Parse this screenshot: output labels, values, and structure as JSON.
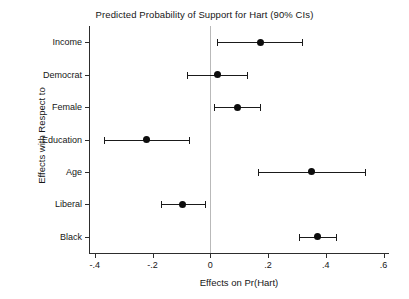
{
  "chart_data": {
    "type": "scatter",
    "title": "Predicted Probability of Support for Hart (90% CIs)",
    "xlabel": "Effects on Pr(Hart)",
    "ylabel": "Effects with Respect to",
    "xlim": [
      -0.42,
      0.6188
    ],
    "grid": false,
    "legend": "none",
    "zero_reference_line": 0,
    "xticks": [
      -0.4,
      -0.2,
      0,
      0.2,
      0.4,
      0.6
    ],
    "xtick_labels": [
      "-.4",
      "-.2",
      "0",
      ".2",
      ".4",
      ".6"
    ],
    "categories": [
      "Income",
      "Democrat",
      "Female",
      "Education",
      "Age",
      "Liberal",
      "Black"
    ],
    "series": [
      {
        "name": "Marginal effect (90% CI)",
        "marker": "filled-circle",
        "color": "#0d0d0d",
        "points": [
          {
            "category": "Income",
            "value": 0.175,
            "ci_low": 0.022,
            "ci_high": 0.318
          },
          {
            "category": "Democrat",
            "value": 0.024,
            "ci_low": -0.082,
            "ci_high": 0.126
          },
          {
            "category": "Female",
            "value": 0.093,
            "ci_low": 0.014,
            "ci_high": 0.171
          },
          {
            "category": "Education",
            "value": -0.222,
            "ci_low": -0.369,
            "ci_high": -0.075
          },
          {
            "category": "Age",
            "value": 0.35,
            "ci_low": 0.165,
            "ci_high": 0.537
          },
          {
            "category": "Liberal",
            "value": -0.095,
            "ci_low": -0.171,
            "ci_high": -0.02
          },
          {
            "category": "Black",
            "value": 0.37,
            "ci_low": 0.308,
            "ci_high": 0.434
          }
        ]
      }
    ]
  }
}
